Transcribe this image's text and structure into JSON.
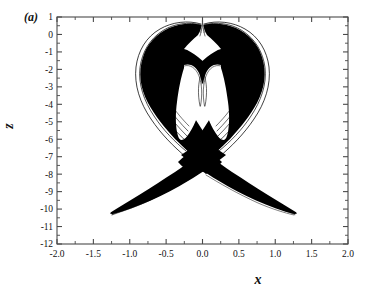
{
  "figure": {
    "panel_label": "(a)",
    "background_color": "#ffffff",
    "trace_color": "#000000",
    "axis_color": "#4a4a4a"
  },
  "chart_data": {
    "type": "line",
    "title": "",
    "subtitle": "",
    "panel": "(a)",
    "plot_kind": "phase-portrait strange attractor",
    "xlabel": "x",
    "ylabel": "z",
    "xlim": [
      -2.0,
      2.0
    ],
    "ylim": [
      -12,
      1
    ],
    "grid": false,
    "legend": null,
    "x_ticks": [
      -2.0,
      -1.5,
      -1.0,
      -0.5,
      0.0,
      0.5,
      1.0,
      1.5,
      2.0
    ],
    "x_tick_labels": [
      "-2.0",
      "-1.5",
      "-1.0",
      "-0.5",
      "0.0",
      "0.5",
      "1.0",
      "1.5",
      "2.0"
    ],
    "x_minor_step": 0.25,
    "y_ticks": [
      1,
      0,
      -1,
      -2,
      -3,
      -4,
      -5,
      -6,
      -7,
      -8,
      -9,
      -10,
      -11,
      -12
    ],
    "y_tick_labels": [
      "1",
      "0",
      "-1",
      "-2",
      "-3",
      "-4",
      "-5",
      "-6",
      "-7",
      "-8",
      "-9",
      "-10",
      "-11",
      "-12"
    ],
    "y_minor_step": 0.5,
    "tick_direction": "in",
    "series": [
      {
        "name": "trajectory",
        "color": "#000000",
        "description": "Dense chaotic trajectory forming a heart/butterfly shaped upper lobe with two white teardrop voids and two thin lower wings that cross near the origin.",
        "extent_x": [
          -1.37,
          1.37
        ],
        "extent_z": [
          -9.6,
          -0.05
        ],
        "features": {
          "upper_cusp": {
            "x": 0.0,
            "z": -0.05
          },
          "upper_lobe_top": {
            "z": -0.1
          },
          "upper_lobe_outer_x": [
            -0.95,
            0.95
          ],
          "upper_lobe_bottom": {
            "z": -6.2
          },
          "crossing_point": {
            "x": 0.0,
            "z": -6.2
          },
          "left_wing_tip": {
            "x": -1.31,
            "z": -9.6
          },
          "right_wing_tip": {
            "x": 1.37,
            "z": -9.6
          },
          "void_left": {
            "center_x": -0.33,
            "top_z": -2.65,
            "bottom_z": -5.9
          },
          "void_right": {
            "center_x": 0.33,
            "top_z": -2.65,
            "bottom_z": -5.9
          }
        }
      }
    ]
  }
}
